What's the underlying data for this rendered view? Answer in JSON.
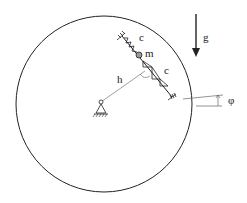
{
  "diagram": {
    "type": "mechanical-schematic",
    "labels": {
      "gravity": "g",
      "spring_upper": "c",
      "spring_lower": "c",
      "mass": "m",
      "lever": "h",
      "angle": "φ"
    },
    "colors": {
      "stroke": "#222222",
      "thin_line": "#888888",
      "mass_fill": "#999999",
      "background": "#ffffff"
    }
  }
}
